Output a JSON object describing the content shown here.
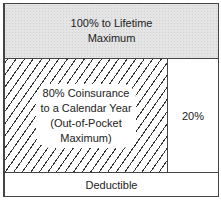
{
  "diagram": {
    "top_box": {
      "lines": [
        "100% to Lifetime",
        "Maximum"
      ]
    },
    "coinsurance_box": {
      "lines": [
        "80% Coinsurance",
        "to a Calendar Year",
        "(Out-of-Pocket",
        "Maximum)"
      ],
      "pattern": "diagonal-hatch"
    },
    "insured_share_box": {
      "label": "20%"
    },
    "bottom_box": {
      "label": "Deductible"
    }
  }
}
